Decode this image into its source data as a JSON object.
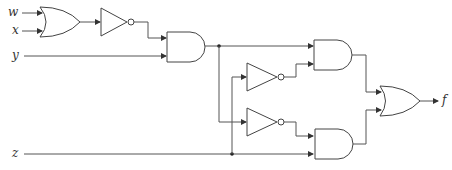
{
  "diagram": {
    "type": "logic-circuit",
    "inputs": [
      "w",
      "x",
      "y",
      "z"
    ],
    "output": "f",
    "gates": [
      {
        "id": "or1",
        "type": "OR",
        "inputs": [
          "w",
          "x"
        ]
      },
      {
        "id": "not1",
        "type": "NOT",
        "inputs": [
          "or1"
        ]
      },
      {
        "id": "and1",
        "type": "AND",
        "inputs": [
          "not1",
          "y"
        ]
      },
      {
        "id": "not2",
        "type": "NOT",
        "inputs": [
          "z"
        ]
      },
      {
        "id": "not3",
        "type": "NOT",
        "inputs": [
          "and1"
        ]
      },
      {
        "id": "and2",
        "type": "AND",
        "inputs": [
          "and1",
          "not2"
        ]
      },
      {
        "id": "and3",
        "type": "AND",
        "inputs": [
          "not3",
          "z"
        ]
      },
      {
        "id": "or2",
        "type": "OR",
        "inputs": [
          "and2",
          "and3"
        ]
      }
    ],
    "labels": {
      "w": "w",
      "x": "x",
      "y": "y",
      "z": "z",
      "f": "f"
    },
    "colors": {
      "line": "#555555",
      "text": "#333333",
      "background": "#ffffff"
    }
  }
}
